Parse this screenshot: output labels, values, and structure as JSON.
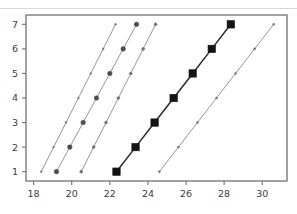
{
  "chart_data": {
    "type": "scatter",
    "title": "",
    "subtitle": "",
    "xlabel": "",
    "ylabel": "",
    "xlim": [
      17.6,
      31.3
    ],
    "ylim": [
      0.62,
      7.38
    ],
    "grid": false,
    "legend": "none",
    "xticks": [
      18,
      20,
      22,
      24,
      26,
      28,
      30
    ],
    "xtick_labels": [
      "18",
      "20",
      "22",
      "24",
      "26",
      "28",
      "30"
    ],
    "yticks": [
      1,
      2,
      3,
      4,
      5,
      6,
      7
    ],
    "ytick_labels": [
      "1",
      "2",
      "3",
      "4",
      "5",
      "6",
      "7"
    ],
    "y_values": [
      1,
      2,
      3,
      4,
      5,
      6,
      7
    ],
    "series": [
      {
        "name": "series-1",
        "marker": "point-small",
        "marker_size": 2.0,
        "color": "#7a7a7a",
        "line_color": "#8a8a8a",
        "x": [
          18.4,
          19.05,
          19.7,
          20.35,
          21.0,
          21.65,
          22.3
        ],
        "values": [
          1,
          2,
          3,
          4,
          5,
          6,
          7
        ]
      },
      {
        "name": "series-2",
        "marker": "circle",
        "marker_size": 4.6,
        "color": "#4d4d4d",
        "line_color": "#8a8a8a",
        "x": [
          19.2,
          19.9,
          20.6,
          21.3,
          22.0,
          22.7,
          23.4
        ],
        "values": [
          1,
          2,
          3,
          4,
          5,
          6,
          7
        ]
      },
      {
        "name": "series-3",
        "marker": "diamond-small",
        "marker_size": 2.6,
        "color": "#6e6e6e",
        "line_color": "#8a8a8a",
        "x": [
          20.5,
          21.15,
          21.8,
          22.45,
          23.1,
          23.75,
          24.4
        ],
        "values": [
          1,
          2,
          3,
          4,
          5,
          6,
          7
        ]
      },
      {
        "name": "series-4",
        "marker": "square",
        "marker_size": 7.4,
        "color": "#141414",
        "line_color": "#2b2b2b",
        "x": [
          22.35,
          23.35,
          24.35,
          25.35,
          26.35,
          27.35,
          28.35
        ],
        "values": [
          1,
          2,
          3,
          4,
          5,
          6,
          7
        ]
      },
      {
        "name": "series-5",
        "marker": "point-small",
        "marker_size": 2.1,
        "color": "#6e6e6e",
        "line_color": "#8a8a8a",
        "x": [
          24.6,
          25.6,
          26.6,
          27.6,
          28.6,
          29.6,
          30.6
        ],
        "values": [
          1,
          2,
          3,
          4,
          5,
          6,
          7
        ]
      }
    ],
    "colors": {
      "axis": "#707070",
      "frame": "#707070",
      "tick_label": "#3b3b3b",
      "highlight_series": "#141414",
      "background": "#ffffff"
    }
  }
}
